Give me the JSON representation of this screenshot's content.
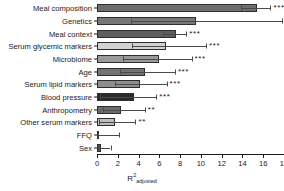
{
  "chart_data": {
    "type": "bar",
    "orientation": "horizontal",
    "title": "",
    "xlabel": "R2adjusted",
    "xlabel_base": "R",
    "xlabel_superscript": "2",
    "xlabel_subscript": "adjusted",
    "ylabel": "",
    "xlim": [
      0,
      18
    ],
    "xticks": [
      0,
      2,
      4,
      6,
      8,
      10,
      12,
      14,
      16,
      18
    ],
    "xtick_labels": [
      "0",
      "2",
      "4",
      "6",
      "8",
      "10",
      "12",
      "14",
      "16",
      "18"
    ],
    "grid": false,
    "legend": false,
    "categories": [
      "Meal composition",
      "Genetics",
      "Meal context",
      "Serum glycemic markers",
      "Microbiome",
      "Age",
      "Serum lipid markers",
      "Blood pressure",
      "Anthropometry",
      "Other serum markers",
      "FFQ",
      "Sex"
    ],
    "values": [
      15.4,
      9.5,
      7.6,
      6.6,
      6.0,
      4.6,
      4.1,
      3.6,
      2.3,
      1.7,
      0.2,
      0.4
    ],
    "error_low": [
      13.9,
      3.3,
      6.4,
      3.4,
      2.5,
      2.2,
      1.7,
      0.3,
      0.6,
      0.2,
      0.1,
      0.1
    ],
    "error_high": [
      16.7,
      17.8,
      8.6,
      10.5,
      9.1,
      7.5,
      6.7,
      5.7,
      4.6,
      3.7,
      2.1,
      1.3
    ],
    "significance": [
      "***",
      "***",
      "***",
      "***",
      "***",
      "***",
      "***",
      "***",
      "**",
      "**",
      "",
      ""
    ],
    "bar_colors": [
      "#6e6e6e",
      "#777777",
      "#5e5e5e",
      "#d2d2d2",
      "#9a9a9a",
      "#737373",
      "#8d8d8d",
      "#2a2a2a",
      "#6a6a6a",
      "#bdbdbd",
      "#f0f0f0",
      "#555555"
    ],
    "axis_color": "#1a1a1a",
    "error_bar_color": "#4a4a4a"
  }
}
